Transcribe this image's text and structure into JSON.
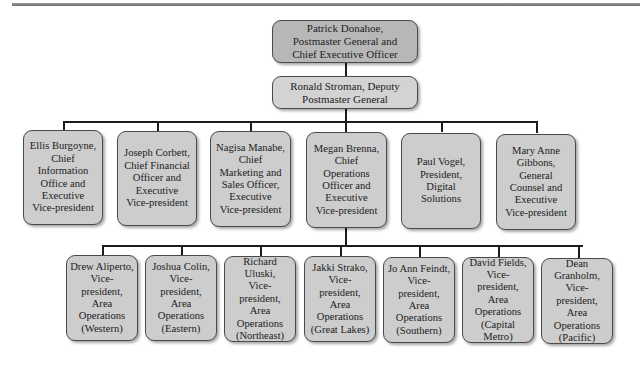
{
  "chart": {
    "ceo": {
      "label": "Patrick Donahoe,\nPostmaster General and\nChief Executive Officer"
    },
    "deputy": {
      "label": "Ronald Stroman, Deputy\nPostmaster General"
    },
    "executives": [
      {
        "label": "Ellis Burgoyne,\nChief\nInformation\nOffice and\nExecutive\nVice-president"
      },
      {
        "label": "Joseph Corbett,\nChief Financial\nOfficer and\nExecutive\nVice-president"
      },
      {
        "label": "Nagisa Manabe,\nChief\nMarketing and\nSales Officer,\nExecutive\nVice-president"
      },
      {
        "label": "Megan Brenna,\nChief\nOperations\nOfficer and\nExecutive\nVice-president"
      },
      {
        "label": "Paul Vogel,\nPresident,\nDigital\nSolutions"
      },
      {
        "label": "Mary Anne\nGibbons,\nGeneral\nCounsel and\nExecutive\nVice-president"
      }
    ],
    "area_vps": [
      {
        "label": "Drew Aliperto,\nVice-president,\nArea\nOperations\n(Western)"
      },
      {
        "label": "Joshua Colin,\nVice-president,\nArea\nOperations\n(Eastern)"
      },
      {
        "label": "Richard\nUluski,\nVice-president,\nArea\nOperations\n(Northeast)"
      },
      {
        "label": "Jakki Strako,\nVice-president,\nArea\nOperations\n(Great Lakes)"
      },
      {
        "label": "Jo Ann Feindt,\nVice-president,\nArea\nOperations\n(Southern)"
      },
      {
        "label": "David Fields,\nVice-president,\nArea\nOperations\n(Capital Metro)"
      },
      {
        "label": "Dean\nGranholm,\nVice-president,\nArea\nOperations\n(Pacific)"
      }
    ]
  }
}
